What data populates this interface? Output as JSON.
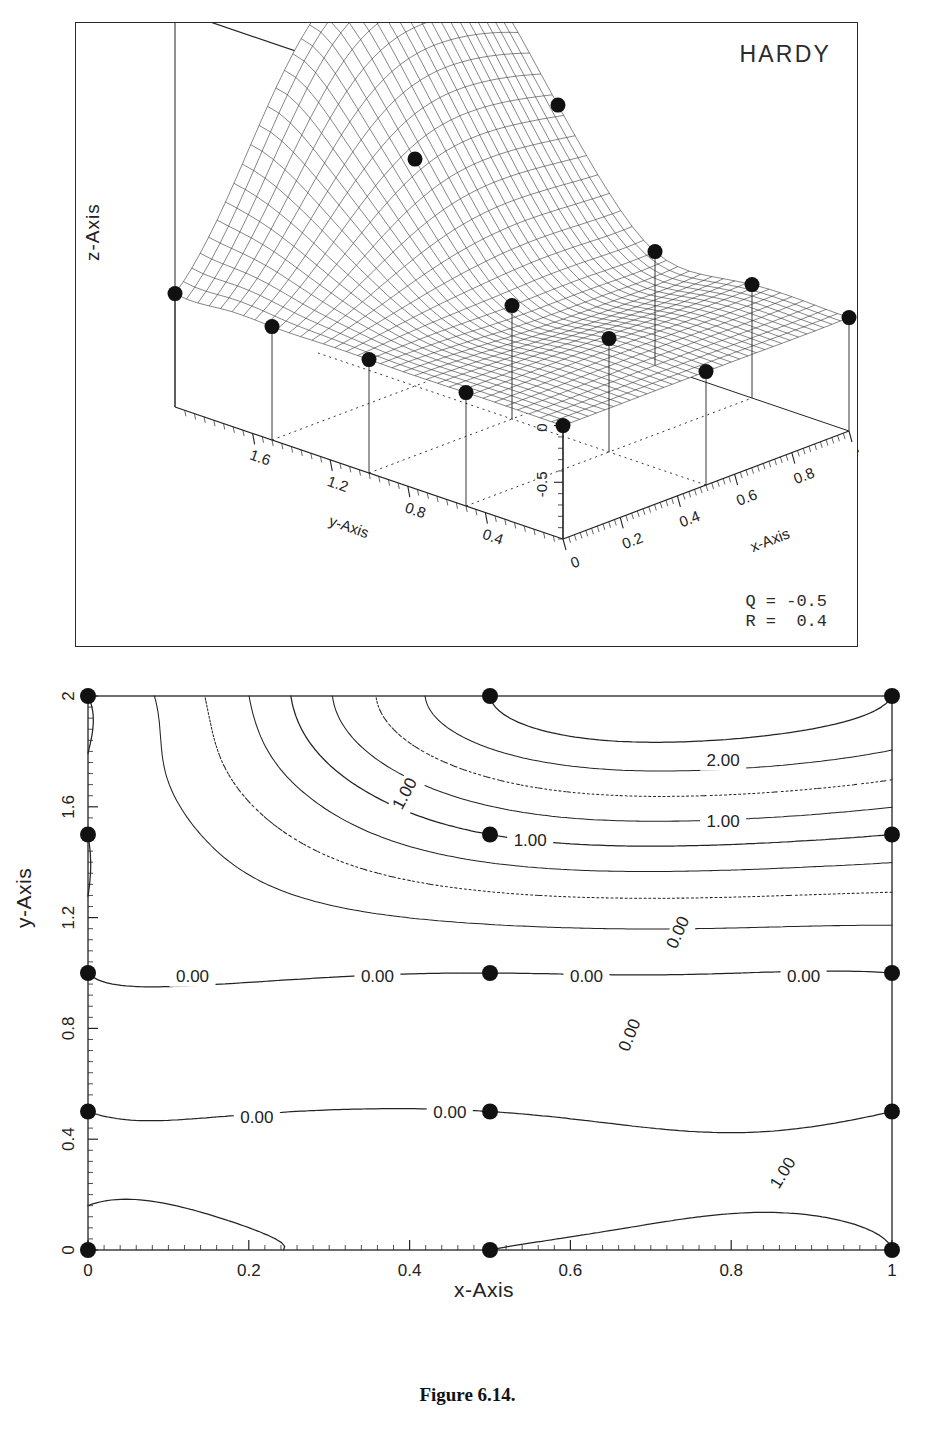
{
  "caption": "Figure 6.14.",
  "surface_panel": {
    "title": "HARDY",
    "parameters": "Q = -0.5\nR =  0.4",
    "params": [
      {
        "name": "Q",
        "value": "-0.5"
      },
      {
        "name": "R",
        "value": "0.4"
      }
    ],
    "x_axis_label": "x-Axis",
    "y_axis_label": "y-Axis",
    "z_axis_label": "z-Axis"
  },
  "contour_panel": {
    "x_axis_label": "x-Axis",
    "y_axis_label": "y-Axis"
  },
  "chart_data": [
    {
      "type": "surface",
      "title": "HARDY",
      "xlabel": "x-Axis",
      "ylabel": "y-Axis",
      "zlabel": "z-Axis",
      "xlim": [
        0,
        1
      ],
      "ylim": [
        0,
        2
      ],
      "zlim": [
        -1,
        2.5
      ],
      "x_ticks": [
        "0",
        "0.2",
        "0.4",
        "0.6",
        "0.8",
        "1"
      ],
      "x_tick_values": [
        0,
        0.2,
        0.4,
        0.6,
        0.8,
        1
      ],
      "y_ticks": [
        "1.6",
        "1.2",
        "0.8",
        "0.4"
      ],
      "y_tick_values": [
        1.6,
        1.2,
        0.8,
        0.4
      ],
      "z_ticks": [
        "-0.5",
        "0",
        "0.5",
        "1",
        "1.5",
        "2",
        "2.5"
      ],
      "z_tick_values": [
        -0.5,
        0,
        0.5,
        1,
        1.5,
        2,
        2.5
      ],
      "grid": false,
      "legend": "none",
      "annotations": [
        "Q = -0.5",
        "R =  0.4"
      ],
      "data_points": [
        {
          "x": 0.0,
          "y": 0.0,
          "z": 0.0
        },
        {
          "x": 0.0,
          "y": 0.5,
          "z": 0.0
        },
        {
          "x": 0.0,
          "y": 1.0,
          "z": 0.0
        },
        {
          "x": 0.0,
          "y": 1.5,
          "z": 0.0
        },
        {
          "x": 0.0,
          "y": 2.0,
          "z": 0.0
        },
        {
          "x": 0.5,
          "y": 0.0,
          "z": 0.0
        },
        {
          "x": 0.5,
          "y": 0.5,
          "z": 0.0
        },
        {
          "x": 0.5,
          "y": 1.0,
          "z": 0.0
        },
        {
          "x": 0.5,
          "y": 1.5,
          "z": 1.0
        },
        {
          "x": 0.5,
          "y": 2.0,
          "z": 2.0
        },
        {
          "x": 1.0,
          "y": 0.0,
          "z": 0.0
        },
        {
          "x": 1.0,
          "y": 0.5,
          "z": 0.0
        },
        {
          "x": 1.0,
          "y": 1.0,
          "z": 0.0
        },
        {
          "x": 1.0,
          "y": 1.5,
          "z": 1.0
        },
        {
          "x": 1.0,
          "y": 2.0,
          "z": 2.0
        }
      ]
    },
    {
      "type": "contour",
      "xlabel": "x-Axis",
      "ylabel": "y-Axis",
      "xlim": [
        0,
        1
      ],
      "ylim": [
        0,
        2
      ],
      "x_ticks": [
        "0",
        "0.2",
        "0.4",
        "0.6",
        "0.8",
        "1"
      ],
      "x_tick_values": [
        0,
        0.2,
        0.4,
        0.6,
        0.8,
        1
      ],
      "y_ticks": [
        "0",
        "0.4",
        "0.8",
        "1.2",
        "1.6",
        "2"
      ],
      "y_tick_values": [
        0,
        0.4,
        0.8,
        1.2,
        1.6,
        2
      ],
      "grid": false,
      "legend": "none",
      "contour_levels": [
        0.0,
        1.0,
        2.0
      ],
      "inline_labels": [
        {
          "text": "2.00",
          "x": 0.79,
          "y": 1.77
        },
        {
          "text": "1.00",
          "x": 0.4,
          "y": 1.66
        },
        {
          "text": "1.00",
          "x": 0.55,
          "y": 1.48
        },
        {
          "text": "1.00",
          "x": 0.79,
          "y": 1.55
        },
        {
          "text": "0.00",
          "x": 0.13,
          "y": 0.99
        },
        {
          "text": "0.00",
          "x": 0.36,
          "y": 0.99
        },
        {
          "text": "0.00",
          "x": 0.62,
          "y": 0.99
        },
        {
          "text": "0.00",
          "x": 0.89,
          "y": 0.99
        },
        {
          "text": "0.00",
          "x": 0.74,
          "y": 1.16
        },
        {
          "text": "0.00",
          "x": 0.68,
          "y": 0.79
        },
        {
          "text": "0.00",
          "x": 0.21,
          "y": 0.48
        },
        {
          "text": "0.00",
          "x": 0.45,
          "y": 0.5
        },
        {
          "text": "1.00",
          "x": 0.87,
          "y": 0.29
        }
      ],
      "data_points": [
        {
          "x": 0.0,
          "y": 0.0
        },
        {
          "x": 0.0,
          "y": 0.5
        },
        {
          "x": 0.0,
          "y": 1.0
        },
        {
          "x": 0.0,
          "y": 1.5
        },
        {
          "x": 0.0,
          "y": 2.0
        },
        {
          "x": 0.5,
          "y": 0.0
        },
        {
          "x": 0.5,
          "y": 0.5
        },
        {
          "x": 0.5,
          "y": 1.0
        },
        {
          "x": 0.5,
          "y": 1.5
        },
        {
          "x": 0.5,
          "y": 2.0
        },
        {
          "x": 1.0,
          "y": 0.0
        },
        {
          "x": 1.0,
          "y": 0.5
        },
        {
          "x": 1.0,
          "y": 1.0
        },
        {
          "x": 1.0,
          "y": 1.5
        },
        {
          "x": 1.0,
          "y": 2.0
        }
      ]
    }
  ]
}
